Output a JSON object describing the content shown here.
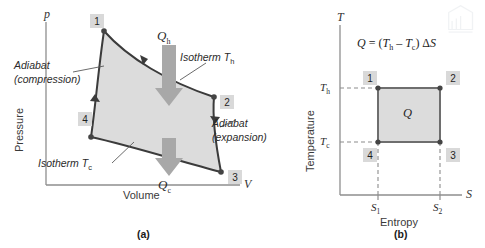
{
  "panel_a": {
    "caption": "(a)",
    "y_axis_symbol": "p",
    "y_axis_label": "Pressure",
    "x_axis_symbol": "V",
    "x_axis_label": "Volume",
    "states": [
      "1",
      "2",
      "4",
      "3"
    ],
    "state_1": "1",
    "state_2": "2",
    "state_3": "3",
    "state_4": "4",
    "heat_in_symbol": "Q",
    "heat_in_sub": "h",
    "heat_out_symbol": "Q",
    "heat_out_sub": "c",
    "anno_adiabat_compression_line1": "Adiabat",
    "anno_adiabat_compression_line2": "(compression)",
    "anno_adiabat_expansion_line1": "Adiabat",
    "anno_adiabat_expansion_line2": "(expansion)",
    "anno_isotherm_hot": "Isotherm T",
    "anno_isotherm_hot_sub": "h",
    "anno_isotherm_cold": "Isotherm T",
    "anno_isotherm_cold_sub": "c"
  },
  "panel_b": {
    "caption": "(b)",
    "y_axis_symbol": "T",
    "y_axis_label": "Temperature",
    "x_axis_symbol": "S",
    "x_axis_label": "Entropy",
    "states": [
      "1",
      "2",
      "3",
      "4"
    ],
    "state_1": "1",
    "state_2": "2",
    "state_3": "3",
    "state_4": "4",
    "equation_q": "Q",
    "equation_eq": " = (",
    "equation_th": "T",
    "equation_th_sub": "h",
    "equation_minus": " – ",
    "equation_tc": "T",
    "equation_tc_sub": "c",
    "equation_close": ") Δ",
    "equation_s": "S",
    "equation_full": "Q = (Tₕ – Tᴄ) ΔS",
    "tick_th": "T",
    "tick_th_sub": "h",
    "tick_tc": "T",
    "tick_tc_sub": "c",
    "tick_s1": "S",
    "tick_s1_sub": "1",
    "tick_s2": "S",
    "tick_s2_sub": "2",
    "area_label": "Q"
  },
  "colors": {
    "fill_gray": "#dcdcdc",
    "curve_dark": "#3b3b3b",
    "axis_gray": "#8e8e8e",
    "arrow_gray": "#a8a8a8",
    "state_box_bg": "#d9d9d9",
    "rect_stroke": "#6e6e6e",
    "background": "#ffffff"
  },
  "watermark": {
    "name": "book-page-icon"
  }
}
